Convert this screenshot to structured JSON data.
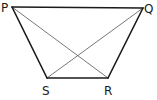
{
  "diagram": {
    "type": "trapezium",
    "vertices": [
      {
        "name": "P",
        "x": 12,
        "y": 7,
        "label_x": 1,
        "label_y": 12
      },
      {
        "name": "Q",
        "x": 143,
        "y": 8,
        "label_x": 144,
        "label_y": 13
      },
      {
        "name": "R",
        "x": 108,
        "y": 78,
        "label_x": 104,
        "label_y": 95
      },
      {
        "name": "S",
        "x": 47,
        "y": 78,
        "label_x": 42,
        "label_y": 95
      }
    ],
    "sides": [
      {
        "from": "P",
        "to": "Q"
      },
      {
        "from": "Q",
        "to": "R"
      },
      {
        "from": "R",
        "to": "S"
      },
      {
        "from": "S",
        "to": "P"
      }
    ],
    "diagonals": [
      {
        "from": "P",
        "to": "R"
      },
      {
        "from": "Q",
        "to": "S"
      }
    ],
    "labels": {
      "P": "P",
      "Q": "Q",
      "R": "R",
      "S": "S"
    },
    "colors": {
      "side": "#1a1a1a",
      "diagonal": "#555555",
      "background": "#ffffff"
    }
  }
}
